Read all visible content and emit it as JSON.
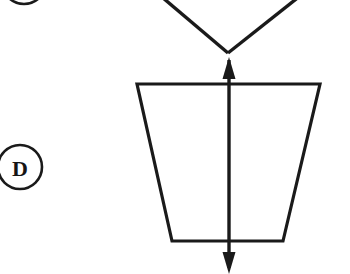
{
  "page": {
    "background_color": "#ffffff",
    "ink_color": "#1a1a1a",
    "width": 350,
    "height": 274
  },
  "labels": {
    "item_d": "D",
    "item_c_partial": "C"
  },
  "figure": {
    "name": "trapezoid-with-vertical-symmetry-axis",
    "stroke_color": "#1a1a1a",
    "stroke_width": 3.2,
    "trapezoid": {
      "top_left": [
        137,
        84
      ],
      "top_right": [
        320,
        84
      ],
      "bottom_right": [
        283,
        241
      ],
      "bottom_left": [
        172,
        241
      ]
    },
    "axis_arrow": {
      "x": 229,
      "top_y": 58,
      "bottom_y": 272,
      "double_headed": true,
      "head_width": 13,
      "head_length": 19
    },
    "chevron": {
      "vertex": [
        228,
        53
      ],
      "left_end": [
        158,
        -6
      ],
      "right_end": [
        303,
        -6
      ]
    }
  },
  "markers": {
    "d_circle": {
      "center_x": 20,
      "center_y": 167,
      "radius": 22,
      "stroke_width": 2.6
    },
    "c_circle_partial": {
      "center_x": 24,
      "center_y": -18,
      "radius": 22,
      "stroke_width": 2.6
    }
  }
}
